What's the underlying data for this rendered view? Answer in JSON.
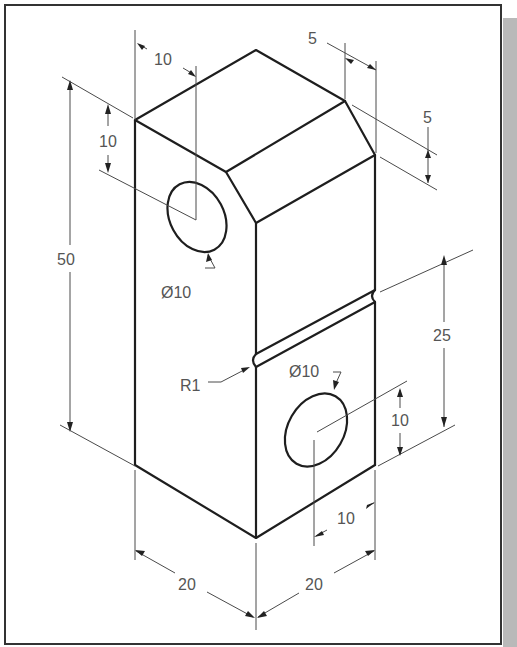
{
  "drawing": {
    "type": "isometric technical drawing",
    "colors": {
      "line": "#1e1e1e",
      "dimension": "#4a4a4a",
      "text": "#555555",
      "frame": "#333333",
      "shadow": "#b9b9b9"
    },
    "dimensions": {
      "top_hole_offset_x": "10",
      "top_hole_offset_y": "10",
      "overall_height": "50",
      "chamfer_horizontal": "5",
      "chamfer_vertical": "5",
      "top_hole_diameter": "Ø10",
      "groove_radius": "R1",
      "groove_height": "25",
      "bottom_hole_diameter": "Ø10",
      "bottom_hole_offset_y": "10",
      "bottom_hole_offset_x": "10",
      "width_left": "20",
      "width_right": "20"
    }
  }
}
